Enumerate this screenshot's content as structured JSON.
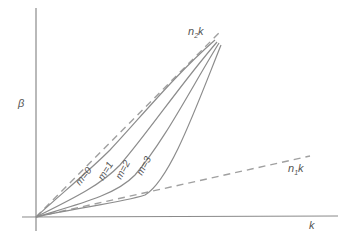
{
  "diagram": {
    "type": "dispersion-diagram",
    "axes": {
      "x_label": "k",
      "y_label": "β"
    },
    "asymptotes": [
      {
        "name": "upper",
        "label_main": "n",
        "label_sub": "2",
        "label_tail": "k"
      },
      {
        "name": "lower",
        "label_main": "n",
        "label_sub": "1",
        "label_tail": "k"
      }
    ],
    "modes": [
      {
        "label": "m=0"
      },
      {
        "label": "m=1"
      },
      {
        "label": "m=2"
      },
      {
        "label": "m=3"
      }
    ],
    "colors": {
      "axis": "#8a8a8a",
      "dashed": "#a0a0a0",
      "curve": "#8c8c8c",
      "text": "#555555"
    }
  }
}
